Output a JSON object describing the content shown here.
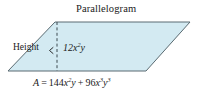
{
  "figure": {
    "kind": "geometry-diagram",
    "title": "Parallelogram",
    "height_label": "Height",
    "interior_label": "12x2y",
    "interior_label_parts": {
      "coefficient": "12",
      "var1": "x",
      "exp1": "2",
      "var2": "y"
    },
    "area_formula": "A = 144x2y + 96x3y3",
    "area_formula_parts": {
      "area_symbol": "A",
      "equals": "=",
      "term1_coefficient": "144",
      "term1_var1": "x",
      "term1_exp1": "2",
      "term1_var2": "y",
      "plus": "+",
      "term2_coefficient": "96",
      "term2_var1": "x",
      "term2_exp1": "3",
      "term2_var2": "y",
      "term2_exp2": "3"
    },
    "colors": {
      "fill": "#d3eaf2",
      "stroke": "#5a6b72",
      "text": "#1a1a1a",
      "background": "#ffffff"
    },
    "geometry": {
      "vertices": [
        {
          "name": "top-left",
          "x": 55,
          "y": 22
        },
        {
          "name": "top-right",
          "x": 190,
          "y": 22
        },
        {
          "name": "bottom-right",
          "x": 146,
          "y": 71
        },
        {
          "name": "bottom-left",
          "x": 8,
          "y": 71
        }
      ],
      "height_line": {
        "x": 57,
        "y_top": 22,
        "y_bottom": 71,
        "style": "dashed"
      }
    }
  }
}
